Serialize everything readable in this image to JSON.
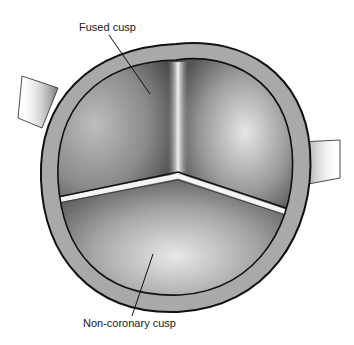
{
  "figure": {
    "labels": {
      "fused_cusp": "Fused cusp",
      "non_coronary_cusp": "Non-coronary cusp"
    },
    "colors": {
      "background": "#ffffff",
      "wall": "#a8a8a8",
      "outline": "#111111",
      "cusp_dark": "#6e6e6e",
      "cusp_light": "#d8d8d8"
    }
  }
}
